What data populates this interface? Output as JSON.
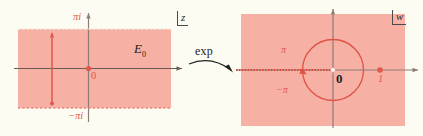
{
  "figure": {
    "background_color": "#fdfcf3",
    "region_color": "#f6b0a4",
    "accent_color": "#e2574a",
    "axis_color": "#6b5a55"
  },
  "left_panel": {
    "name": "z-plane",
    "corner_tag": "z",
    "region_label": "E",
    "region_label_sub": "0",
    "origin_label": "0",
    "top_boundary_label": "πi",
    "bottom_boundary_label": "−πi",
    "marked_segment": {
      "description": "vertical red segment",
      "endpoints_visible": true
    }
  },
  "transform": {
    "label": "exp",
    "arrow": "curved-right-arrow"
  },
  "right_panel": {
    "name": "w-plane",
    "corner_tag": "w",
    "origin_label": "0",
    "unit_point_label": "1",
    "upper_angle_label": "π",
    "lower_angle_label": "−π",
    "circle": {
      "description": "red unit-image circle centered at origin"
    },
    "branch_cut": {
      "description": "dotted red ray along the negative real axis"
    }
  }
}
